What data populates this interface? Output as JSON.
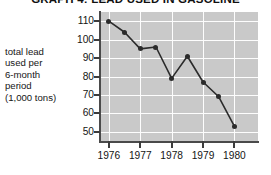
{
  "chart_data": {
    "type": "line",
    "title": "GRAPH 4: LEAD USED IN GASOLINE",
    "xlabel": "",
    "ylabel": "total lead used per 6-month period (1,000 tons)",
    "ylabel_lines": [
      "total lead",
      "used per",
      "6-month",
      "period",
      "(1,000 tons)"
    ],
    "ylim": [
      45,
      115
    ],
    "yticks": [
      110,
      100,
      90,
      80,
      70,
      60,
      50
    ],
    "ytick_labels": [
      "110",
      "100",
      "90",
      "80",
      "70",
      "60",
      "50"
    ],
    "xlim": [
      1975.75,
      1980.75
    ],
    "xticks": [
      1976,
      1977,
      1978,
      1979,
      1980
    ],
    "xtick_labels": [
      "1976",
      "1977",
      "1978",
      "1979",
      "1980"
    ],
    "grid": true,
    "legend": false,
    "marker": "filled-circle",
    "x": [
      1976.0,
      1976.5,
      1977.0,
      1977.5,
      1978.0,
      1978.5,
      1979.0,
      1979.5,
      1980.0
    ],
    "values": [
      110,
      104,
      95,
      96,
      79,
      91,
      77,
      69,
      53
    ],
    "points": [
      {
        "x": 1976.0,
        "y": 110
      },
      {
        "x": 1976.5,
        "y": 104
      },
      {
        "x": 1977.0,
        "y": 95
      },
      {
        "x": 1977.5,
        "y": 96
      },
      {
        "x": 1978.0,
        "y": 79
      },
      {
        "x": 1978.5,
        "y": 91
      },
      {
        "x": 1979.0,
        "y": 77
      },
      {
        "x": 1979.5,
        "y": 69
      },
      {
        "x": 1980.0,
        "y": 53
      }
    ],
    "colors": {
      "plot_background": "#c9c9c9",
      "gridline": "#fdfdfd",
      "line": "#2b2b2b",
      "marker": "#2b2b2b",
      "axis": "#4a4a4a",
      "text": "#141414",
      "page_background": "#ffffff"
    }
  }
}
